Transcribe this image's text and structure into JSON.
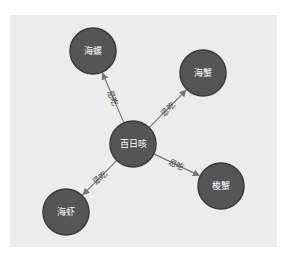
{
  "diagram": {
    "type": "directed-graph",
    "colors": {
      "background": "#ececec",
      "node_fill": "#555555",
      "node_stroke": "#3a3a3a",
      "edge": "#777777",
      "node_text": "#ffffff",
      "edge_text": "#333333"
    },
    "nodes": [
      {
        "id": "center",
        "label": "百日咳",
        "x": 133,
        "y": 144,
        "r": 23
      },
      {
        "id": "n1",
        "label": "海螺",
        "x": 93,
        "y": 51,
        "r": 23
      },
      {
        "id": "n2",
        "label": "海蟹",
        "x": 203,
        "y": 73,
        "r": 23
      },
      {
        "id": "n3",
        "label": "梭蟹",
        "x": 221,
        "y": 186,
        "r": 23
      },
      {
        "id": "n4",
        "label": "海虾",
        "x": 66,
        "y": 212,
        "r": 23
      }
    ],
    "edges": [
      {
        "from": "center",
        "to": "n1",
        "label": "忌吃"
      },
      {
        "from": "center",
        "to": "n2",
        "label": "忌吃"
      },
      {
        "from": "center",
        "to": "n3",
        "label": "忌吃"
      },
      {
        "from": "center",
        "to": "n4",
        "label": "忌吃"
      }
    ]
  }
}
